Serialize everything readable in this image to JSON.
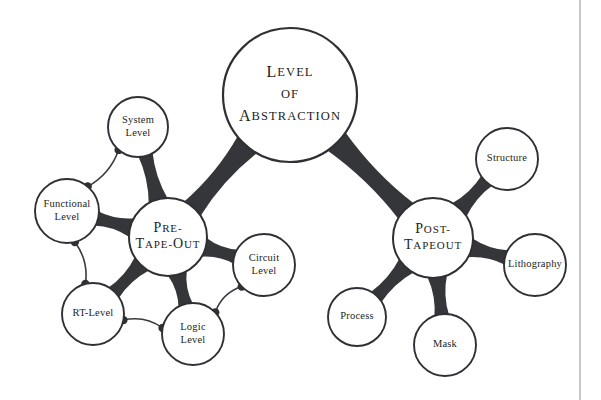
{
  "diagram": {
    "type": "radial-bubble-tree",
    "colors": {
      "background": "#ffffff",
      "node_fill": "#ffffff",
      "node_stroke": "#2f3033",
      "connector": "#35363a",
      "arc": "#3a3b3f",
      "text": "#1d1e21",
      "page_rule": "#9a9a9c"
    },
    "root": {
      "id": "level-of-abstraction",
      "lines": [
        "Level",
        "of",
        "Abstraction"
      ],
      "cx": 290,
      "cy": 95,
      "r": 67
    },
    "branches": [
      {
        "id": "pre-tape-out",
        "lines": [
          "Pre-",
          "Tape-Out"
        ],
        "cx": 168,
        "cy": 237,
        "r": 39,
        "leaves": [
          {
            "id": "system-level",
            "lines": [
              "System",
              "Level"
            ],
            "cx": 138,
            "cy": 127,
            "r": 30
          },
          {
            "id": "functional-level",
            "lines": [
              "Functional",
              "Level"
            ],
            "cx": 67,
            "cy": 211,
            "r": 32
          },
          {
            "id": "rt-level",
            "lines": [
              "RT-Level"
            ],
            "cx": 93,
            "cy": 314,
            "r": 31
          },
          {
            "id": "logic-level",
            "lines": [
              "Logic",
              "Level"
            ],
            "cx": 193,
            "cy": 334,
            "r": 31
          },
          {
            "id": "circuit-level",
            "lines": [
              "Circuit",
              "Level"
            ],
            "cx": 264,
            "cy": 265,
            "r": 31
          }
        ],
        "sibling_arcs": [
          {
            "from": "system-level",
            "to": "functional-level"
          },
          {
            "from": "functional-level",
            "to": "rt-level"
          },
          {
            "from": "rt-level",
            "to": "logic-level"
          },
          {
            "from": "logic-level",
            "to": "circuit-level"
          }
        ]
      },
      {
        "id": "post-tapeout",
        "lines": [
          "Post-",
          "Tapeout"
        ],
        "cx": 433,
        "cy": 238,
        "r": 40,
        "leaves": [
          {
            "id": "structure",
            "lines": [
              "Structure"
            ],
            "cx": 507,
            "cy": 159,
            "r": 31
          },
          {
            "id": "lithography",
            "lines": [
              "Lithography"
            ],
            "cx": 535,
            "cy": 265,
            "r": 31
          },
          {
            "id": "mask",
            "lines": [
              "Mask"
            ],
            "cx": 445,
            "cy": 345,
            "r": 31
          },
          {
            "id": "process",
            "lines": [
              "Process"
            ],
            "cx": 357,
            "cy": 317,
            "r": 29
          }
        ],
        "sibling_arcs": []
      }
    ],
    "page_rule": {
      "x": 580,
      "y1": 0,
      "y2": 400
    }
  }
}
